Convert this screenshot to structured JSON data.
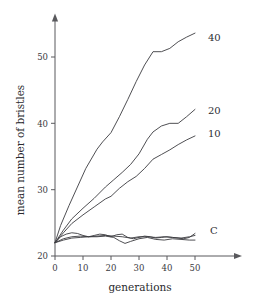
{
  "chart_data": {
    "type": "line",
    "title": "",
    "xlabel": "generations",
    "ylabel": "mean number of bristles",
    "xlim": [
      0,
      57
    ],
    "ylim": [
      20,
      55
    ],
    "xticks": [
      0,
      10,
      20,
      30,
      40,
      50
    ],
    "xtick_labels": [
      "0",
      "10",
      "20",
      "30",
      "40",
      "50"
    ],
    "yticks": [
      20,
      30,
      40,
      50
    ],
    "ytick_labels": [
      "20",
      "30",
      "40",
      "50"
    ],
    "grid": false,
    "legend_position": "right-end-of-line",
    "axes_style": "arrow-tipped open axes",
    "series": [
      {
        "name": "40",
        "label": "40",
        "label_value": 53.6,
        "x": [
          0,
          2,
          5,
          8,
          11,
          15,
          17,
          20,
          23,
          26,
          29,
          32,
          35,
          38,
          41,
          44,
          47,
          50
        ],
        "values": [
          22.0,
          24.6,
          27.6,
          30.4,
          33.2,
          36.1,
          37.2,
          38.6,
          41.0,
          43.6,
          46.3,
          48.8,
          50.8,
          50.8,
          51.3,
          52.3,
          53.0,
          53.6
        ]
      },
      {
        "name": "20",
        "label": "20",
        "label_value": 42.1,
        "x": [
          0,
          3,
          6,
          10,
          14,
          18,
          21,
          24,
          27,
          30,
          33,
          35,
          38,
          41,
          44,
          47,
          50
        ],
        "values": [
          22.0,
          23.9,
          25.6,
          27.2,
          28.7,
          30.4,
          31.5,
          32.6,
          33.8,
          35.4,
          37.6,
          38.7,
          39.6,
          40.0,
          40.0,
          41.0,
          42.1
        ]
      },
      {
        "name": "10",
        "label": "10",
        "label_value": 38.1,
        "x": [
          0,
          3,
          6,
          10,
          14,
          18,
          20,
          23,
          26,
          29,
          32,
          35,
          38,
          41,
          44,
          47,
          50
        ],
        "values": [
          22.0,
          23.5,
          24.9,
          26.2,
          27.4,
          28.6,
          29.0,
          30.2,
          31.2,
          32.0,
          33.2,
          34.6,
          35.3,
          36.0,
          36.8,
          37.5,
          38.1
        ]
      },
      {
        "name": "C-upper",
        "label": "C",
        "label_value": 23.2,
        "x": [
          0,
          2,
          4,
          6,
          8,
          10,
          12,
          14,
          16,
          18,
          20,
          22,
          24,
          26,
          28,
          30,
          32,
          34,
          36,
          38,
          40,
          42,
          44,
          46,
          48,
          50
        ],
        "values": [
          22.0,
          22.9,
          23.3,
          23.5,
          23.4,
          23.1,
          22.9,
          23.1,
          23.3,
          23.2,
          22.9,
          23.2,
          23.3,
          22.8,
          22.6,
          22.8,
          23.0,
          22.9,
          22.7,
          22.8,
          22.9,
          22.8,
          22.7,
          22.6,
          22.8,
          23.4
        ]
      },
      {
        "name": "C-middle",
        "label": "",
        "label_value": 23.0,
        "x": [
          0,
          3,
          6,
          9,
          12,
          15,
          18,
          21,
          24,
          27,
          30,
          33,
          36,
          39,
          42,
          45,
          48,
          50
        ],
        "values": [
          22.0,
          22.6,
          22.9,
          23.0,
          22.9,
          23.0,
          23.1,
          23.0,
          22.9,
          22.7,
          22.9,
          22.9,
          22.8,
          22.9,
          22.8,
          22.7,
          22.9,
          23.1
        ]
      },
      {
        "name": "C-lower",
        "label": "",
        "label_value": 22.4,
        "x": [
          0,
          3,
          6,
          9,
          12,
          15,
          18,
          21,
          23,
          25,
          27,
          30,
          33,
          36,
          39,
          42,
          45,
          48,
          50
        ],
        "values": [
          22.0,
          22.4,
          22.7,
          22.8,
          22.9,
          22.9,
          23.0,
          22.8,
          22.3,
          21.9,
          22.2,
          22.6,
          22.8,
          22.5,
          22.4,
          22.6,
          22.5,
          22.4,
          22.4
        ]
      }
    ]
  }
}
